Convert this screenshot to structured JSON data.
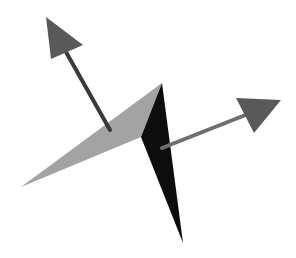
{
  "diagram": {
    "background": "#ffffff",
    "facets": [
      {
        "name": "left-facet",
        "color": "#a3a3a3",
        "points": "21,187 162,83 141,137"
      },
      {
        "name": "right-facet",
        "color": "#0d0d0d",
        "points": "162,83 183,243 141,137"
      }
    ],
    "arrows": [
      {
        "name": "normal-arrow-left",
        "shaft": {
          "x1": 110,
          "y1": 130,
          "x2": 66,
          "y2": 52
        },
        "head": "46,17 83,45 51,59",
        "shaft_color": "#3a3a3a",
        "head_color": "#595959"
      },
      {
        "name": "normal-arrow-right",
        "shaft": {
          "x1": 162,
          "y1": 148,
          "x2": 248,
          "y2": 114
        },
        "head": "236,98 281,100 254,133",
        "shaft_color": "#6e6e6e",
        "head_color": "#595959"
      }
    ]
  }
}
